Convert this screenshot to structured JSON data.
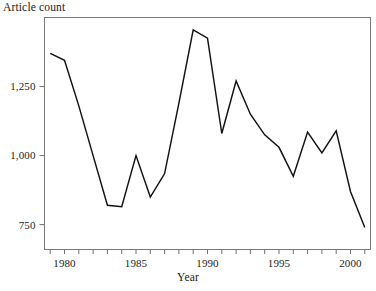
{
  "chart_data": {
    "type": "line",
    "title": "",
    "xlabel": "Year",
    "ylabel": "Article count",
    "ylabel_position": "top-left",
    "grid": false,
    "legend": "none",
    "xlim": [
      1978.6,
      2001.4
    ],
    "ylim": [
      660,
      1500
    ],
    "x_tick_labels": [
      "1980",
      "1985",
      "1990",
      "1995",
      "2000"
    ],
    "x_tick_label_values": [
      1980,
      1985,
      1990,
      1995,
      2000
    ],
    "x_minor_ticks_every": 1,
    "x_minor_tick_values": [
      1979,
      1980,
      1981,
      1982,
      1983,
      1984,
      1985,
      1986,
      1987,
      1988,
      1989,
      1990,
      1991,
      1992,
      1993,
      1994,
      1995,
      1996,
      1997,
      1998,
      1999,
      2000,
      2001
    ],
    "y_tick_labels": [
      "750",
      "1,000",
      "1,250"
    ],
    "y_tick_label_values": [
      750,
      1000,
      1250
    ],
    "series": [
      {
        "name": "Article count",
        "color": "#111111",
        "x": [
          1979,
          1980,
          1981,
          1982,
          1983,
          1984,
          1985,
          1986,
          1987,
          1988,
          1989,
          1990,
          1991,
          1992,
          1993,
          1994,
          1995,
          1996,
          1997,
          1998,
          1999,
          2000,
          2001
        ],
        "values": [
          1370,
          1345,
          1180,
          1000,
          820,
          815,
          1000,
          850,
          935,
          1190,
          1455,
          1425,
          1080,
          1270,
          1150,
          1075,
          1030,
          925,
          1085,
          1010,
          1090,
          870,
          740
        ]
      }
    ]
  },
  "figure": {
    "ylabel_text": "Article count",
    "xlabel_text": "Year"
  }
}
